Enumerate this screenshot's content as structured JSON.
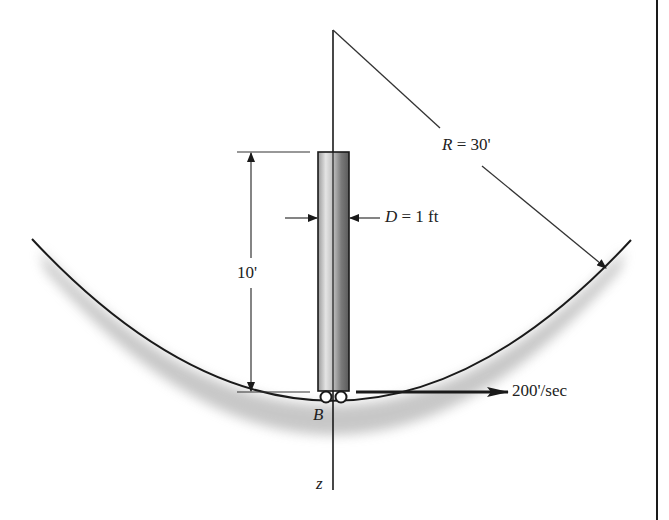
{
  "diagram": {
    "type": "physics-mechanics",
    "labels": {
      "radius": "R = 30'",
      "radius_symbol": "R",
      "radius_value": "= 30'",
      "diameter_symbol": "D",
      "diameter_value": "= 1 ft",
      "length": "10'",
      "velocity": "200'/sec",
      "point": "B",
      "axis": "z"
    },
    "colors": {
      "line": "#1a1a1a",
      "shadow": "#9a9a9a",
      "rod_light": "#e8e8e8",
      "rod_dark": "#6a6a6a"
    }
  }
}
